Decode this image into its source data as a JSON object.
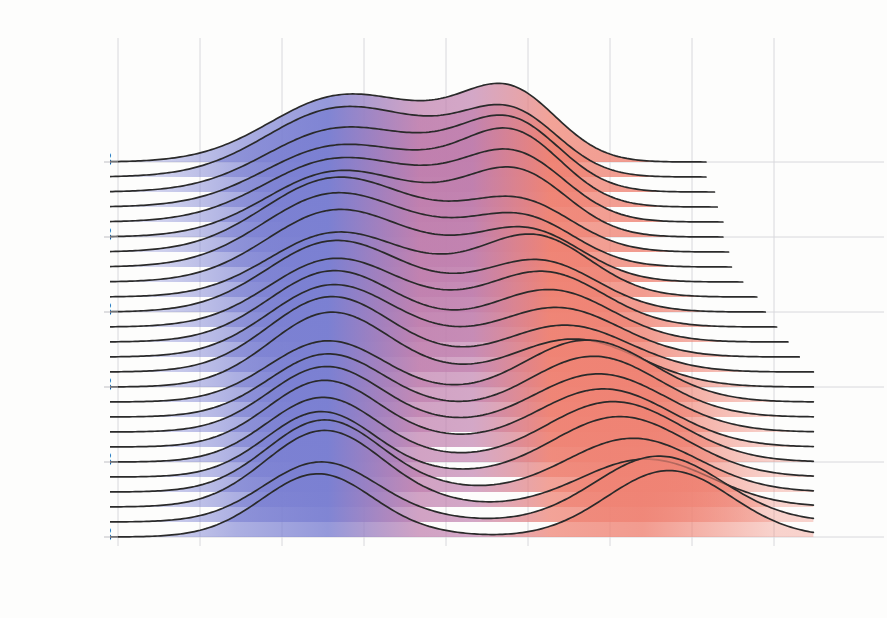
{
  "chart_data": {
    "type": "area",
    "title": "DW-NOMINATE by party of U.S. House: 1963-2013",
    "subtitle": "",
    "xlabel": "Distribution of 1st Dimension DW-NOMINATE by party",
    "ylabel": "First Year of Each Congress",
    "xlim": [
      -1.15,
      1.15
    ],
    "ylim": [
      1963,
      2013
    ],
    "grid": true,
    "legend": false,
    "xticks": [
      -1.0,
      -0.75,
      -0.5,
      -0.25,
      0.0,
      0.25,
      0.5,
      0.75,
      1.0
    ],
    "xticklabels": [
      "-1.00",
      "-0.75",
      "-0.50",
      "-0.25",
      "0.00",
      "0.25",
      "0.50",
      "0.75",
      "1.00"
    ],
    "yticks": [
      1963,
      1973,
      1983,
      1993,
      2003,
      2013
    ],
    "yticklabels": [
      "1963",
      "1973",
      "1983",
      "1993",
      "2003",
      "2013"
    ],
    "colors": {
      "democrat_blue": "#7b80d2",
      "republican_red": "#ef8374",
      "midpoint_purple": "#c07fae",
      "curve_line": "#2a2a2a",
      "grid": "#d8d8dc",
      "background": "#fdfdfc",
      "text": "#1b1b1b"
    },
    "ridge_overlap": 3.1,
    "series": [
      {
        "name": "1963",
        "year": 1963,
        "dem": {
          "mean": -0.325,
          "sd": 0.215,
          "weight": 0.59
        },
        "rep": {
          "mean": 0.2,
          "sd": 0.145,
          "weight": 0.41
        },
        "dem2": {
          "mean": -0.02,
          "sd": 0.16,
          "weight": 0.13
        }
      },
      {
        "name": "1965",
        "year": 1965,
        "dem": {
          "mean": -0.33,
          "sd": 0.22,
          "weight": 0.63
        },
        "rep": {
          "mean": 0.205,
          "sd": 0.145,
          "weight": 0.37
        },
        "dem2": {
          "mean": -0.02,
          "sd": 0.16,
          "weight": 0.13
        }
      },
      {
        "name": "1967",
        "year": 1967,
        "dem": {
          "mean": -0.33,
          "sd": 0.22,
          "weight": 0.58
        },
        "rep": {
          "mean": 0.205,
          "sd": 0.15,
          "weight": 0.42
        },
        "dem2": {
          "mean": -0.02,
          "sd": 0.16,
          "weight": 0.12
        }
      },
      {
        "name": "1969",
        "year": 1969,
        "dem": {
          "mean": -0.335,
          "sd": 0.22,
          "weight": 0.56
        },
        "rep": {
          "mean": 0.21,
          "sd": 0.15,
          "weight": 0.44
        },
        "dem2": {
          "mean": -0.02,
          "sd": 0.16,
          "weight": 0.12
        }
      },
      {
        "name": "1971",
        "year": 1971,
        "dem": {
          "mean": -0.335,
          "sd": 0.22,
          "weight": 0.58
        },
        "rep": {
          "mean": 0.215,
          "sd": 0.155,
          "weight": 0.42
        },
        "dem2": {
          "mean": -0.02,
          "sd": 0.16,
          "weight": 0.11
        }
      },
      {
        "name": "1973",
        "year": 1973,
        "dem": {
          "mean": -0.335,
          "sd": 0.215,
          "weight": 0.59
        },
        "rep": {
          "mean": 0.22,
          "sd": 0.155,
          "weight": 0.41
        },
        "dem2": {
          "mean": -0.02,
          "sd": 0.16,
          "weight": 0.1
        }
      },
      {
        "name": "1975",
        "year": 1975,
        "dem": {
          "mean": -0.34,
          "sd": 0.215,
          "weight": 0.67
        },
        "rep": {
          "mean": 0.23,
          "sd": 0.16,
          "weight": 0.33
        },
        "dem2": {
          "mean": -0.02,
          "sd": 0.16,
          "weight": 0.09
        }
      },
      {
        "name": "1977",
        "year": 1977,
        "dem": {
          "mean": -0.34,
          "sd": 0.215,
          "weight": 0.67
        },
        "rep": {
          "mean": 0.235,
          "sd": 0.16,
          "weight": 0.33
        },
        "dem2": {
          "mean": -0.02,
          "sd": 0.15,
          "weight": 0.08
        }
      },
      {
        "name": "1979",
        "year": 1979,
        "dem": {
          "mean": -0.335,
          "sd": 0.21,
          "weight": 0.64
        },
        "rep": {
          "mean": 0.25,
          "sd": 0.165,
          "weight": 0.36
        },
        "dem2": {
          "mean": -0.02,
          "sd": 0.15,
          "weight": 0.07
        }
      },
      {
        "name": "1981",
        "year": 1981,
        "dem": {
          "mean": -0.335,
          "sd": 0.205,
          "weight": 0.56
        },
        "rep": {
          "mean": 0.27,
          "sd": 0.17,
          "weight": 0.44
        },
        "dem2": {
          "mean": -0.02,
          "sd": 0.15,
          "weight": 0.06
        }
      },
      {
        "name": "1983",
        "year": 1983,
        "dem": {
          "mean": -0.34,
          "sd": 0.205,
          "weight": 0.62
        },
        "rep": {
          "mean": 0.285,
          "sd": 0.175,
          "weight": 0.38
        },
        "dem2": {
          "mean": -0.02,
          "sd": 0.15,
          "weight": 0.05
        }
      },
      {
        "name": "1985",
        "year": 1985,
        "dem": {
          "mean": -0.34,
          "sd": 0.2,
          "weight": 0.58
        },
        "rep": {
          "mean": 0.3,
          "sd": 0.18,
          "weight": 0.42
        },
        "dem2": {
          "mean": -0.02,
          "sd": 0.15,
          "weight": 0.05
        }
      },
      {
        "name": "1987",
        "year": 1987,
        "dem": {
          "mean": -0.345,
          "sd": 0.195,
          "weight": 0.59
        },
        "rep": {
          "mean": 0.32,
          "sd": 0.185,
          "weight": 0.41
        },
        "dem2": {
          "mean": -0.02,
          "sd": 0.15,
          "weight": 0.04
        }
      },
      {
        "name": "1989",
        "year": 1989,
        "dem": {
          "mean": -0.345,
          "sd": 0.195,
          "weight": 0.6
        },
        "rep": {
          "mean": 0.34,
          "sd": 0.19,
          "weight": 0.4
        },
        "dem2": {
          "mean": -0.02,
          "sd": 0.14,
          "weight": 0.04
        }
      },
      {
        "name": "1991",
        "year": 1991,
        "dem": {
          "mean": -0.35,
          "sd": 0.19,
          "weight": 0.61
        },
        "rep": {
          "mean": 0.365,
          "sd": 0.195,
          "weight": 0.39
        },
        "dem2": {
          "mean": -0.02,
          "sd": 0.14,
          "weight": 0.03
        }
      },
      {
        "name": "1993",
        "year": 1993,
        "dem": {
          "mean": -0.35,
          "sd": 0.185,
          "weight": 0.59
        },
        "rep": {
          "mean": 0.39,
          "sd": 0.2,
          "weight": 0.41
        },
        "dem2": {
          "mean": -0.02,
          "sd": 0.14,
          "weight": 0.03
        }
      },
      {
        "name": "1995",
        "year": 1995,
        "dem": {
          "mean": -0.36,
          "sd": 0.18,
          "weight": 0.47
        },
        "rep": {
          "mean": 0.43,
          "sd": 0.2,
          "weight": 0.53
        },
        "dem2": {
          "mean": -0.02,
          "sd": 0.14,
          "weight": 0.02
        }
      },
      {
        "name": "1997",
        "year": 1997,
        "dem": {
          "mean": -0.36,
          "sd": 0.178,
          "weight": 0.48
        },
        "rep": {
          "mean": 0.45,
          "sd": 0.2,
          "weight": 0.52
        },
        "dem2": {
          "mean": -0.02,
          "sd": 0.13,
          "weight": 0.02
        }
      },
      {
        "name": "1999",
        "year": 1999,
        "dem": {
          "mean": -0.365,
          "sd": 0.175,
          "weight": 0.49
        },
        "rep": {
          "mean": 0.465,
          "sd": 0.205,
          "weight": 0.51
        },
        "dem2": {
          "mean": -0.02,
          "sd": 0.13,
          "weight": 0.02
        }
      },
      {
        "name": "2001",
        "year": 2001,
        "dem": {
          "mean": -0.37,
          "sd": 0.172,
          "weight": 0.49
        },
        "rep": {
          "mean": 0.48,
          "sd": 0.205,
          "weight": 0.51
        },
        "dem2": {
          "mean": -0.02,
          "sd": 0.13,
          "weight": 0.02
        }
      },
      {
        "name": "2003",
        "year": 2003,
        "dem": {
          "mean": -0.375,
          "sd": 0.17,
          "weight": 0.47
        },
        "rep": {
          "mean": 0.51,
          "sd": 0.205,
          "weight": 0.53
        },
        "dem2": {
          "mean": -0.02,
          "sd": 0.12,
          "weight": 0.01
        }
      },
      {
        "name": "2005",
        "year": 2005,
        "dem": {
          "mean": -0.38,
          "sd": 0.168,
          "weight": 0.47
        },
        "rep": {
          "mean": 0.53,
          "sd": 0.205,
          "weight": 0.53
        },
        "dem2": {
          "mean": -0.02,
          "sd": 0.12,
          "weight": 0.01
        }
      },
      {
        "name": "2007",
        "year": 2007,
        "dem": {
          "mean": -0.37,
          "sd": 0.175,
          "weight": 0.54
        },
        "rep": {
          "mean": 0.57,
          "sd": 0.2,
          "weight": 0.46
        },
        "dem2": {
          "mean": -0.02,
          "sd": 0.12,
          "weight": 0.01
        }
      },
      {
        "name": "2009",
        "year": 2009,
        "dem": {
          "mean": -0.37,
          "sd": 0.18,
          "weight": 0.59
        },
        "rep": {
          "mean": 0.61,
          "sd": 0.2,
          "weight": 0.41
        },
        "dem2": {
          "mean": -0.02,
          "sd": 0.12,
          "weight": 0.01
        }
      },
      {
        "name": "2011",
        "year": 2011,
        "dem": {
          "mean": -0.38,
          "sd": 0.175,
          "weight": 0.45
        },
        "rep": {
          "mean": 0.65,
          "sd": 0.195,
          "weight": 0.55
        },
        "dem2": {
          "mean": -0.02,
          "sd": 0.12,
          "weight": 0.01
        }
      },
      {
        "name": "2013",
        "year": 2013,
        "dem": {
          "mean": -0.39,
          "sd": 0.17,
          "weight": 0.46
        },
        "rep": {
          "mean": 0.68,
          "sd": 0.19,
          "weight": 0.54
        },
        "dem2": {
          "mean": -0.02,
          "sd": 0.12,
          "weight": 0.01
        }
      }
    ]
  }
}
